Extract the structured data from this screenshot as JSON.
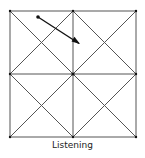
{
  "caption": "Listening",
  "colors": {
    "line": "#555555",
    "arrow": "#111111",
    "background": "#ffffff"
  },
  "grid": {
    "square": {
      "x1": 10,
      "y1": 11,
      "x2": 136,
      "y2": 137
    },
    "center": {
      "x": 73,
      "y": 74
    }
  },
  "arrow": {
    "start": {
      "x": 38,
      "y": 17
    },
    "end": {
      "x": 80,
      "y": 44
    }
  }
}
